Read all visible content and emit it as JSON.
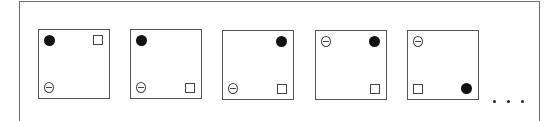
{
  "figure": {
    "symbol_legend": {
      "filled-circle": "●",
      "square": "□",
      "theta-circle": "⊖"
    },
    "panels": [
      {
        "index": 1,
        "filled-circle": "top-left",
        "square": "top-right",
        "theta-circle": "bottom-left",
        "left": 38
      },
      {
        "index": 2,
        "filled-circle": "top-left",
        "square": "bottom-right",
        "theta-circle": "bottom-left",
        "left": 130
      },
      {
        "index": 3,
        "filled-circle": "top-right",
        "square": "bottom-right",
        "theta-circle": "bottom-left",
        "left": 222
      },
      {
        "index": 4,
        "filled-circle": "top-right",
        "square": "bottom-right",
        "theta-circle": "top-left",
        "left": 315
      },
      {
        "index": 5,
        "filled-circle": "bottom-right",
        "square": "bottom-left",
        "theta-circle": "top-left",
        "left": 407
      }
    ],
    "continuation": "..."
  }
}
